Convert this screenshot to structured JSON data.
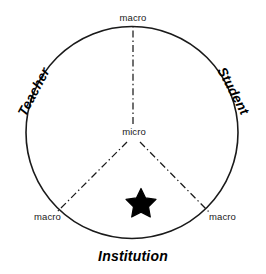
{
  "diagram": {
    "type": "triadic-circle-model",
    "background_color": "#ffffff",
    "stroke_color": "#1a1a1a",
    "circle": {
      "center_x": 132,
      "center_y": 132,
      "radius": 106,
      "stroke_width": 1.6
    },
    "center_marker": {
      "label": "micro",
      "x": 133,
      "y": 133
    },
    "sectors": [
      {
        "id": "teacher",
        "name": "Teacher",
        "label": "Teacher",
        "rotation_deg": -62,
        "position": "left"
      },
      {
        "id": "student",
        "name": "Student",
        "label": "Student",
        "rotation_deg": 62,
        "position": "right"
      },
      {
        "id": "institution",
        "name": "Institution",
        "label": "Institution",
        "rotation_deg": 0,
        "position": "bottom"
      }
    ],
    "boundary_markers": [
      {
        "id": "macro-top",
        "label": "macro",
        "position": "top",
        "x": 133,
        "y": 18
      },
      {
        "id": "macro-bottom-left",
        "label": "macro",
        "position": "bottom-left",
        "x": 48,
        "y": 217
      },
      {
        "id": "macro-bottom-right",
        "label": "macro",
        "position": "bottom-right",
        "x": 223,
        "y": 217
      }
    ],
    "divider_lines": [
      {
        "id": "divider-up",
        "from": "center",
        "to": "macro-top",
        "style": "dash-dot"
      },
      {
        "id": "divider-lower-left",
        "from": "center",
        "to": "macro-bottom-left",
        "style": "dash-dot"
      },
      {
        "id": "divider-lower-right",
        "from": "center",
        "to": "macro-bottom-right",
        "style": "dash-dot"
      }
    ],
    "star_marker": {
      "id": "focus-star",
      "shape": "five-pointed-star",
      "fill": "#000000",
      "x": 141,
      "y": 202,
      "size": 28,
      "sector": "institution"
    }
  }
}
